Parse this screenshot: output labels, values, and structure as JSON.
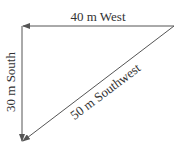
{
  "diagram": {
    "title": "",
    "vectors": [
      {
        "label": "40 m West",
        "magnitude": 40,
        "unit": "m",
        "direction": "West"
      },
      {
        "label": "30 m South",
        "magnitude": 30,
        "unit": "m",
        "direction": "South"
      },
      {
        "label": "50 m Southwest",
        "magnitude": 50,
        "unit": "m",
        "direction": "Southwest"
      }
    ],
    "colors": {
      "line": "#555555",
      "text": "#333333",
      "background": "#ffffff"
    }
  }
}
